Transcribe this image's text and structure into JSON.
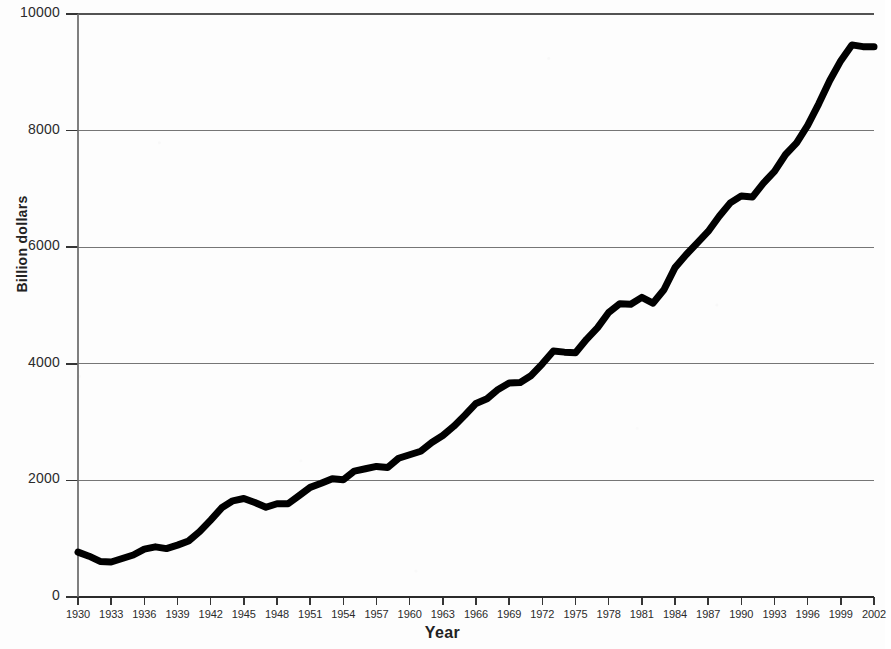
{
  "chart_data": {
    "type": "line",
    "title": "",
    "subtitle": "",
    "xlabel": "Year",
    "ylabel": "Billion dollars",
    "xlim": [
      1930,
      2002
    ],
    "ylim": [
      0,
      10000
    ],
    "grid": "horizontal",
    "legend": "none",
    "y_ticks": [
      0,
      2000,
      4000,
      6000,
      8000,
      10000
    ],
    "y_tick_labels": [
      "0",
      "2000",
      "4000",
      "6000",
      "8000",
      "10000"
    ],
    "x_ticks": [
      1930,
      1933,
      1936,
      1939,
      1942,
      1945,
      1948,
      1951,
      1954,
      1957,
      1960,
      1963,
      1966,
      1969,
      1972,
      1975,
      1978,
      1981,
      1984,
      1987,
      1990,
      1993,
      1996,
      1999,
      2002
    ],
    "x_tick_labels": [
      "1930",
      "1933",
      "1936",
      "1939",
      "1942",
      "1945",
      "1948",
      "1951",
      "1954",
      "1957",
      "1960",
      "1963",
      "1966",
      "1969",
      "1972",
      "1975",
      "1978",
      "1981",
      "1984",
      "1987",
      "1990",
      "1993",
      "1996",
      "1999",
      "2002"
    ],
    "series": [
      {
        "name": "Billion dollars",
        "color": "#000000",
        "line_width": 7,
        "x": [
          1930,
          1931,
          1932,
          1933,
          1934,
          1935,
          1936,
          1937,
          1938,
          1939,
          1940,
          1941,
          1942,
          1943,
          1944,
          1945,
          1946,
          1947,
          1948,
          1949,
          1950,
          1951,
          1952,
          1953,
          1954,
          1955,
          1956,
          1957,
          1958,
          1959,
          1960,
          1961,
          1962,
          1963,
          1964,
          1965,
          1966,
          1967,
          1968,
          1969,
          1970,
          1971,
          1972,
          1973,
          1974,
          1975,
          1976,
          1977,
          1978,
          1979,
          1980,
          1981,
          1982,
          1983,
          1984,
          1985,
          1986,
          1987,
          1988,
          1989,
          1990,
          1991,
          1992,
          1993,
          1994,
          1995,
          1996,
          1997,
          1998,
          1999,
          2000,
          2001,
          2002
        ],
        "y": [
          770,
          700,
          610,
          600,
          660,
          720,
          820,
          860,
          830,
          890,
          960,
          1120,
          1320,
          1530,
          1650,
          1690,
          1620,
          1540,
          1600,
          1600,
          1740,
          1880,
          1950,
          2030,
          2010,
          2160,
          2200,
          2240,
          2220,
          2380,
          2440,
          2500,
          2650,
          2770,
          2930,
          3120,
          3320,
          3400,
          3560,
          3670,
          3680,
          3800,
          4000,
          4220,
          4200,
          4190,
          4420,
          4620,
          4880,
          5030,
          5020,
          5140,
          5040,
          5270,
          5650,
          5870,
          6070,
          6270,
          6530,
          6760,
          6880,
          6860,
          7100,
          7300,
          7590,
          7790,
          8090,
          8460,
          8860,
          9200,
          9470,
          9440,
          9440
        ]
      }
    ],
    "annotations": []
  },
  "axes": {
    "y_title": "Billion dollars",
    "x_title": "Year"
  }
}
